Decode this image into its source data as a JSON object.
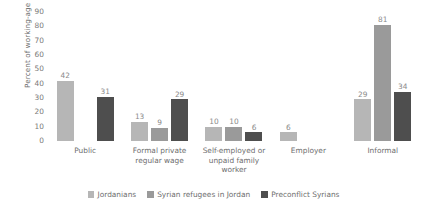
{
  "chart_data": {
    "type": "bar",
    "title": "",
    "xlabel": "",
    "ylabel": "Percent of working-age population",
    "ylim": [
      0,
      90
    ],
    "ytick_step": 10,
    "yticks": [
      90,
      80,
      70,
      60,
      50,
      40,
      30,
      20,
      10,
      0
    ],
    "grid": false,
    "legend_position": "bottom",
    "categories": [
      "Public",
      "Formal private regular wage",
      "Self-employed or unpaid family worker",
      "Employer",
      "Informal"
    ],
    "category_lines": [
      [
        "Public"
      ],
      [
        "Formal private",
        "regular wage"
      ],
      [
        "Self-employed or",
        "unpaid family",
        "worker"
      ],
      [
        "Employer"
      ],
      [
        "Informal"
      ]
    ],
    "series": [
      {
        "name": "Jordanians",
        "color": "#b6b6b6",
        "values": [
          42,
          13,
          10,
          6,
          29
        ]
      },
      {
        "name": "Syrian refugees in Jordan",
        "color": "#9a9a9a",
        "values": [
          null,
          9,
          10,
          null,
          81
        ]
      },
      {
        "name": "Preconflict Syrians",
        "color": "#4e4e4e",
        "values": [
          31,
          29,
          6,
          null,
          34
        ]
      }
    ]
  },
  "legend": {
    "items": [
      {
        "label": "Jordanians",
        "color": "#b6b6b6"
      },
      {
        "label": "Syrian refugees in Jordan",
        "color": "#9a9a9a"
      },
      {
        "label": "Preconflict Syrians",
        "color": "#4e4e4e"
      }
    ]
  }
}
